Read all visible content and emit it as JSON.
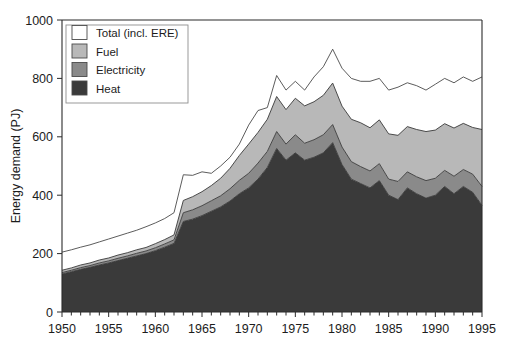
{
  "chart_data": {
    "type": "area",
    "title": "",
    "subtitle": "",
    "xlabel": "",
    "ylabel": "Energy demand (PJ)",
    "xlim": [
      1950,
      1995
    ],
    "ylim": [
      0,
      1000
    ],
    "grid": false,
    "stacked": true,
    "legend_position": "top-left",
    "x_tick_labels": [
      "1950",
      "1955",
      "1960",
      "1965",
      "1970",
      "1975",
      "1980",
      "1985",
      "1990",
      "1995"
    ],
    "x_ticks": [
      1950,
      1955,
      1960,
      1965,
      1970,
      1975,
      1980,
      1985,
      1990,
      1995
    ],
    "x_minor_tick_step": 1,
    "y_tick_labels": [
      "0",
      "200",
      "400",
      "600",
      "800",
      "1000"
    ],
    "y_ticks": [
      0,
      200,
      400,
      600,
      800,
      1000
    ],
    "x": [
      1950,
      1951,
      1952,
      1953,
      1954,
      1955,
      1956,
      1957,
      1958,
      1959,
      1960,
      1961,
      1962,
      1963,
      1964,
      1965,
      1966,
      1967,
      1968,
      1969,
      1970,
      1971,
      1972,
      1973,
      1974,
      1975,
      1976,
      1977,
      1978,
      1979,
      1980,
      1981,
      1982,
      1983,
      1984,
      1985,
      1986,
      1987,
      1988,
      1989,
      1990,
      1991,
      1992,
      1993,
      1994,
      1995
    ],
    "series": [
      {
        "name": "Heat",
        "color": "#3a3a3a",
        "values": [
          130,
          138,
          146,
          153,
          161,
          168,
          176,
          184,
          192,
          200,
          210,
          222,
          235,
          310,
          318,
          330,
          345,
          360,
          380,
          405,
          425,
          455,
          495,
          560,
          520,
          545,
          520,
          530,
          545,
          580,
          505,
          455,
          440,
          425,
          450,
          400,
          385,
          425,
          405,
          390,
          400,
          430,
          405,
          430,
          410,
          365
        ]
      },
      {
        "name": "Electricity",
        "color": "#8a8a8a",
        "values": [
          5,
          5,
          6,
          6,
          7,
          7,
          8,
          8,
          9,
          9,
          10,
          11,
          12,
          30,
          32,
          34,
          36,
          38,
          42,
          46,
          50,
          55,
          55,
          58,
          55,
          62,
          58,
          60,
          62,
          62,
          60,
          60,
          58,
          58,
          58,
          55,
          62,
          55,
          58,
          60,
          58,
          55,
          60,
          58,
          62,
          65
        ]
      },
      {
        "name": "Fuel",
        "color": "#b8b8b8",
        "values": [
          8,
          8,
          9,
          9,
          10,
          10,
          11,
          11,
          12,
          12,
          14,
          15,
          17,
          42,
          45,
          48,
          52,
          60,
          70,
          85,
          100,
          105,
          110,
          120,
          118,
          125,
          128,
          130,
          135,
          142,
          140,
          145,
          150,
          148,
          150,
          155,
          158,
          155,
          162,
          168,
          165,
          160,
          165,
          158,
          160,
          195
        ]
      }
    ],
    "total": {
      "name": "Total (incl. ERE)",
      "color": "#ffffff",
      "values": [
        205,
        213,
        222,
        230,
        240,
        250,
        260,
        270,
        280,
        292,
        305,
        320,
        340,
        470,
        468,
        480,
        475,
        500,
        530,
        575,
        640,
        690,
        700,
        810,
        760,
        790,
        760,
        805,
        840,
        900,
        835,
        800,
        790,
        790,
        800,
        760,
        770,
        785,
        775,
        760,
        780,
        800,
        785,
        805,
        790,
        805
      ]
    },
    "legend": [
      {
        "label": "Total (incl. ERE)",
        "swatch": "#ffffff"
      },
      {
        "label": "Fuel",
        "swatch": "#b8b8b8"
      },
      {
        "label": "Electricity",
        "swatch": "#8a8a8a"
      },
      {
        "label": "Heat",
        "swatch": "#3a3a3a"
      }
    ]
  }
}
